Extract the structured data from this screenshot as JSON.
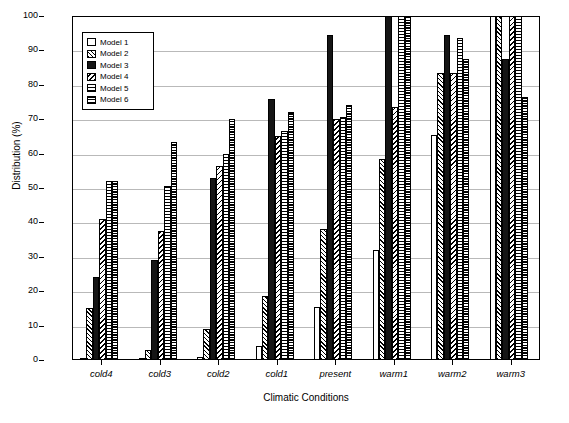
{
  "chart_data": {
    "type": "bar",
    "title": "",
    "xlabel": "Climatic Conditions",
    "ylabel": "Distribution (%)",
    "ylim": [
      0,
      100
    ],
    "yticks": [
      0,
      10,
      20,
      30,
      40,
      50,
      60,
      70,
      80,
      90,
      100
    ],
    "grid": true,
    "legend_position": "top-left",
    "categories": [
      "cold4",
      "cold3",
      "cold2",
      "cold1",
      "present",
      "warm1",
      "warm2",
      "warm3"
    ],
    "series": [
      {
        "name": "Model 1",
        "fill": "white",
        "values": [
          0,
          0,
          1,
          4,
          15.5,
          32,
          65.5,
          100
        ]
      },
      {
        "name": "Model 2",
        "fill": "diagonal-hatch",
        "values": [
          15,
          3,
          9,
          18.5,
          38,
          58.5,
          83.5,
          100
        ]
      },
      {
        "name": "Model 3",
        "fill": "solid-black",
        "values": [
          24,
          29,
          53,
          76,
          94.5,
          100,
          94.5,
          87.5
        ]
      },
      {
        "name": "Model 4",
        "fill": "reverse-hatch",
        "values": [
          41,
          37.5,
          56.5,
          65,
          70,
          73.5,
          83.5,
          100
        ]
      },
      {
        "name": "Model 5",
        "fill": "horizontal-hatch",
        "values": [
          52,
          50.5,
          60,
          66.5,
          70.5,
          100,
          93.5,
          100
        ]
      },
      {
        "name": "Model 6",
        "fill": "fine-horizontal",
        "values": [
          52,
          63.5,
          70,
          72,
          74,
          100,
          87.5,
          76.5
        ]
      }
    ]
  },
  "legend": {
    "items": [
      "Model 1",
      "Model 2",
      "Model 3",
      "Model 4",
      "Model 5",
      "Model 6"
    ]
  },
  "axes": {
    "y_title": "Distribution (%)",
    "x_title": "Climatic Conditions"
  }
}
